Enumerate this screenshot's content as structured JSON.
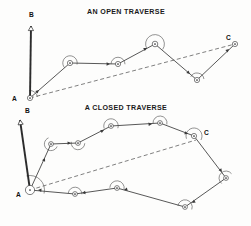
{
  "figure": {
    "background_color": "#fdfdfc",
    "line_color": "#3a3a3a",
    "dashed_color": "#555555",
    "label_color": "#111111",
    "width": 251,
    "height": 226
  },
  "panels": [
    {
      "id": "open-traverse",
      "title": "AN OPEN TRAVERSE",
      "title_x": 126,
      "title_y": 14,
      "labels": [
        {
          "name": "label-b",
          "text": "B",
          "x": 29,
          "y": 17
        },
        {
          "name": "label-a",
          "text": "A",
          "x": 12,
          "y": 101
        },
        {
          "name": "label-c",
          "text": "C",
          "x": 226,
          "y": 40
        }
      ],
      "backsight": {
        "from": [
          30,
          98
        ],
        "to": [
          31,
          26
        ]
      },
      "closing_line": {
        "from": [
          30,
          98
        ],
        "to": [
          235,
          44
        ]
      },
      "stations": [
        {
          "name": "station-a",
          "x": 30,
          "y": 98,
          "r": 2.6,
          "arc_r": 7.5,
          "arc_start": -97,
          "arc_end": -8
        },
        {
          "name": "station-2",
          "x": 70,
          "y": 63,
          "r": 2.6,
          "arc_r": 7.2,
          "arc_start": 138,
          "arc_end": 372
        },
        {
          "name": "station-3",
          "x": 118,
          "y": 64,
          "r": 2.6,
          "arc_r": 7.0,
          "arc_start": 178,
          "arc_end": 362
        },
        {
          "name": "station-4",
          "x": 155,
          "y": 44,
          "r": 2.8,
          "arc_r": 9.4,
          "arc_start": 152,
          "arc_end": 395
        },
        {
          "name": "station-5",
          "x": 197,
          "y": 80,
          "r": 2.6,
          "arc_r": 7.0,
          "arc_start": 207,
          "arc_end": 352
        },
        {
          "name": "station-c",
          "x": 235,
          "y": 44,
          "r": 2.6,
          "arc_r": 0,
          "arc_start": 0,
          "arc_end": 0
        }
      ],
      "legs": [
        {
          "from": [
            30,
            98
          ],
          "to": [
            70,
            63
          ]
        },
        {
          "from": [
            70,
            63
          ],
          "to": [
            118,
            64
          ]
        },
        {
          "from": [
            118,
            64
          ],
          "to": [
            155,
            44
          ]
        },
        {
          "from": [
            155,
            44
          ],
          "to": [
            197,
            80
          ]
        },
        {
          "from": [
            197,
            80
          ],
          "to": [
            235,
            44
          ]
        }
      ],
      "arrows": [
        {
          "at": [
            39,
            90
          ],
          "angle": -41
        },
        {
          "at": [
            110,
            64
          ],
          "angle": 1
        },
        {
          "at": [
            147,
            48
          ],
          "angle": -28
        },
        {
          "at": [
            190,
            74
          ],
          "angle": 40
        },
        {
          "at": [
            229,
            49
          ],
          "angle": -43
        }
      ]
    },
    {
      "id": "closed-traverse",
      "title": "A CLOSED TRAVERSE",
      "title_x": 126,
      "title_y": 110,
      "labels": [
        {
          "name": "label-b",
          "text": "B",
          "x": 25,
          "y": 113
        },
        {
          "name": "label-a",
          "text": "A",
          "x": 16,
          "y": 197
        },
        {
          "name": "label-c",
          "text": "C",
          "x": 204,
          "y": 135
        }
      ],
      "backsight": {
        "from": [
          30,
          190
        ],
        "to": [
          20,
          120
        ]
      },
      "closing_line": {
        "from": [
          30,
          190
        ],
        "to": [
          196,
          140
        ]
      },
      "stations": [
        {
          "name": "station-a",
          "x": 30,
          "y": 190,
          "r": 4.6,
          "arc_r": 14.5,
          "arc_start": -104,
          "arc_end": 14
        },
        {
          "name": "station-2",
          "x": 51,
          "y": 144,
          "r": 2.4,
          "arc_r": 6.6,
          "arc_start": 22,
          "arc_end": 248
        },
        {
          "name": "station-3",
          "x": 78,
          "y": 143,
          "r": 2.4,
          "arc_r": 6.8,
          "arc_start": 2,
          "arc_end": 190
        },
        {
          "name": "station-4",
          "x": 111,
          "y": 126,
          "r": 2.4,
          "arc_r": 7.2,
          "arc_start": 160,
          "arc_end": 378
        },
        {
          "name": "station-5",
          "x": 160,
          "y": 123,
          "r": 2.4,
          "arc_r": 7.0,
          "arc_start": 176,
          "arc_end": 372
        },
        {
          "name": "station-c",
          "x": 194,
          "y": 136,
          "r": 2.6,
          "arc_r": 8.0,
          "arc_start": 160,
          "arc_end": 390
        },
        {
          "name": "station-7",
          "x": 226,
          "y": 178,
          "r": 2.4,
          "arc_r": 7.0,
          "arc_start": 128,
          "arc_end": 322
        },
        {
          "name": "station-8",
          "x": 185,
          "y": 207,
          "r": 2.4,
          "arc_r": 7.2,
          "arc_start": 188,
          "arc_end": 380
        },
        {
          "name": "station-9",
          "x": 117,
          "y": 188,
          "r": 2.4,
          "arc_r": 7.2,
          "arc_start": 182,
          "arc_end": 372
        },
        {
          "name": "station-10",
          "x": 75,
          "y": 194,
          "r": 2.4,
          "arc_r": 6.8,
          "arc_start": 186,
          "arc_end": 362
        }
      ],
      "legs": [
        {
          "from": [
            30,
            190
          ],
          "to": [
            51,
            144
          ]
        },
        {
          "from": [
            51,
            144
          ],
          "to": [
            78,
            143
          ]
        },
        {
          "from": [
            78,
            143
          ],
          "to": [
            111,
            126
          ]
        },
        {
          "from": [
            111,
            126
          ],
          "to": [
            160,
            123
          ]
        },
        {
          "from": [
            160,
            123
          ],
          "to": [
            194,
            136
          ]
        },
        {
          "from": [
            194,
            136
          ],
          "to": [
            226,
            178
          ]
        },
        {
          "from": [
            226,
            178
          ],
          "to": [
            185,
            207
          ]
        },
        {
          "from": [
            185,
            207
          ],
          "to": [
            117,
            188
          ]
        },
        {
          "from": [
            117,
            188
          ],
          "to": [
            75,
            194
          ]
        },
        {
          "from": [
            75,
            194
          ],
          "to": [
            30,
            190
          ]
        }
      ],
      "arrows": [
        {
          "at": [
            45,
            158
          ],
          "angle": -65
        },
        {
          "at": [
            71,
            143
          ],
          "angle": -2
        },
        {
          "at": [
            104,
            130
          ],
          "angle": -27
        },
        {
          "at": [
            152,
            124
          ],
          "angle": -4
        },
        {
          "at": [
            188,
            134
          ],
          "angle": 21
        },
        {
          "at": [
            222,
            172
          ],
          "angle": 53
        },
        {
          "at": [
            192,
            203
          ],
          "angle": 145
        },
        {
          "at": [
            124,
            190
          ],
          "angle": 164
        },
        {
          "at": [
            82,
            193
          ],
          "angle": 172
        },
        {
          "at": [
            38,
            190
          ],
          "angle": 185
        }
      ]
    }
  ]
}
